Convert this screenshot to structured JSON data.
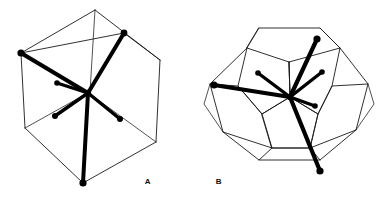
{
  "figure": {
    "title": "",
    "background_color": "#ffffff",
    "ink_color": "#000000",
    "width": 385,
    "height": 199,
    "panels": [
      {
        "id": "panel-a",
        "label": "A",
        "label_x": 148,
        "label_y": 184,
        "polyhedron": "cube",
        "description": "cube viewed along body diagonal with six bonds radiating from central atom",
        "center": [
          88,
          93
        ],
        "cage_vertices": [
          [
            95,
            10
          ],
          [
            21,
            53
          ],
          [
            160,
            60
          ],
          [
            25,
            128
          ],
          [
            83,
            183
          ],
          [
            156,
            142
          ],
          [
            124,
            33
          ],
          [
            88,
            93
          ]
        ],
        "cage_edges": [
          [
            [
              95,
              10
            ],
            [
              21,
              53
            ]
          ],
          [
            [
              95,
              10
            ],
            [
              160,
              60
            ]
          ],
          [
            [
              21,
              53
            ],
            [
              25,
              128
            ]
          ],
          [
            [
              160,
              60
            ],
            [
              156,
              142
            ]
          ],
          [
            [
              25,
              128
            ],
            [
              83,
              183
            ]
          ],
          [
            [
              156,
              142
            ],
            [
              83,
              183
            ]
          ],
          [
            [
              95,
              10
            ],
            [
              88,
              93
            ]
          ],
          [
            [
              88,
              93
            ],
            [
              25,
              128
            ]
          ],
          [
            [
              88,
              93
            ],
            [
              156,
              142
            ]
          ],
          [
            [
              21,
              53
            ],
            [
              124,
              33
            ]
          ],
          [
            [
              124,
              33
            ],
            [
              160,
              60
            ]
          ],
          [
            [
              21,
              53
            ],
            [
              88,
              93
            ]
          ],
          [
            [
              124,
              33
            ],
            [
              88,
              93
            ]
          ]
        ],
        "bonds": [
          {
            "name": "bond-upper-left",
            "to": [
              21,
              53
            ],
            "weight": 4.2,
            "node_r": 3.6
          },
          {
            "name": "bond-upper-right",
            "to": [
              124,
              33
            ],
            "weight": 4.0,
            "node_r": 3.4
          },
          {
            "name": "bond-bottom",
            "to": [
              83,
              183
            ],
            "weight": 4.0,
            "node_r": 3.6
          },
          {
            "name": "bond-mid-left",
            "to": [
              57,
              83
            ],
            "weight": 3.4,
            "node_r": 2.8
          },
          {
            "name": "bond-lower-left",
            "to": [
              55,
              116
            ],
            "weight": 3.4,
            "node_r": 3.0
          },
          {
            "name": "bond-lower-right",
            "to": [
              120,
              119
            ],
            "weight": 3.4,
            "node_r": 3.0
          }
        ]
      },
      {
        "id": "panel-b",
        "label": "B",
        "label_x": 219,
        "label_y": 184,
        "polyhedron": "dodecahedron",
        "description": "pentagonal dodecahedron with six bonds radiating from central atom",
        "center": [
          290,
          97
        ],
        "cage_vertices": [
          [
            259,
            28
          ],
          [
            320,
            28
          ],
          [
            340,
            48
          ],
          [
            332,
            86
          ],
          [
            289,
            62
          ],
          [
            247,
            48
          ],
          [
            238,
            86
          ],
          [
            262,
            114
          ],
          [
            318,
            114
          ],
          [
            210,
            84
          ],
          [
            223,
            132
          ],
          [
            259,
            160
          ],
          [
            320,
            160
          ],
          [
            356,
            130
          ],
          [
            368,
            84
          ],
          [
            248,
            43
          ],
          [
            283,
            22
          ],
          [
            296,
            22
          ],
          [
            247,
            112
          ],
          [
            334,
            112
          ],
          [
            290,
            152
          ],
          [
            205,
            110
          ],
          [
            372,
            110
          ],
          [
            232,
            55
          ],
          [
            349,
            55
          ]
        ],
        "bonds": [
          {
            "name": "bond-left",
            "to": [
              214,
              85
            ],
            "weight": 4.2,
            "node_r": 3.6
          },
          {
            "name": "bond-upper-right",
            "to": [
              317,
              39
            ],
            "weight": 4.2,
            "node_r": 3.6
          },
          {
            "name": "bond-bottom",
            "to": [
              320,
              171
            ],
            "weight": 4.2,
            "node_r": 3.6
          },
          {
            "name": "bond-up-left",
            "to": [
              258,
              73
            ],
            "weight": 3.4,
            "node_r": 2.8
          },
          {
            "name": "bond-up-right",
            "to": [
              322,
              72
            ],
            "weight": 3.4,
            "node_r": 2.8
          },
          {
            "name": "bond-right",
            "to": [
              315,
              106
            ],
            "weight": 3.4,
            "node_r": 2.8
          }
        ]
      }
    ]
  }
}
